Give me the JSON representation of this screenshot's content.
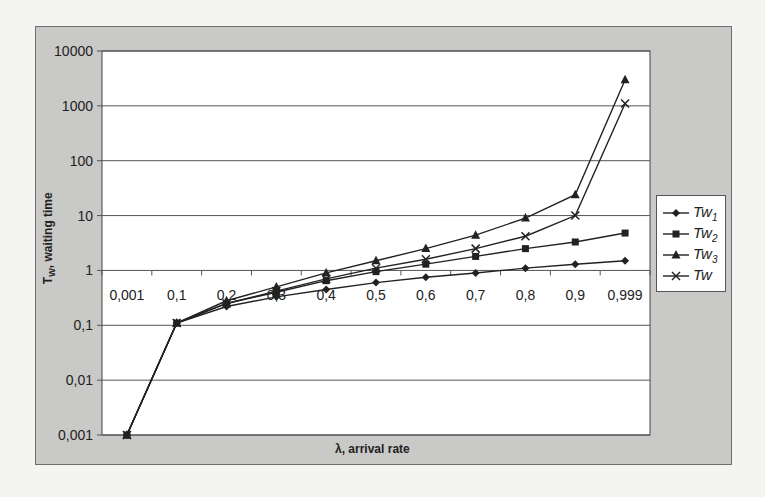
{
  "chart_data": {
    "type": "line",
    "title": "",
    "xlabel": "λ, arrival rate",
    "ylabel": "Tw, waiting time",
    "yscale": "log",
    "ylim": [
      0.001,
      10000
    ],
    "y_ticks": [
      "10000",
      "1000",
      "100",
      "10",
      "1",
      "0,1",
      "0,01",
      "0,001"
    ],
    "categories": [
      "0,001",
      "0,1",
      "0,2",
      "0,3",
      "0,4",
      "0,5",
      "0,6",
      "0,7",
      "0,8",
      "0,9",
      "0,999"
    ],
    "grid": "horizontal",
    "legend_position": "right",
    "series": [
      {
        "name": "Tw1",
        "base": "Tw",
        "sub": "1",
        "marker": "diamond",
        "values": [
          0.001,
          0.11,
          0.22,
          0.33,
          0.45,
          0.6,
          0.75,
          0.9,
          1.1,
          1.3,
          1.5
        ]
      },
      {
        "name": "Tw2",
        "base": "Tw",
        "sub": "2",
        "marker": "square",
        "values": [
          0.001,
          0.11,
          0.25,
          0.4,
          0.65,
          0.95,
          1.3,
          1.8,
          2.5,
          3.3,
          4.8
        ]
      },
      {
        "name": "Tw3",
        "base": "Tw",
        "sub": "3",
        "marker": "triangle",
        "values": [
          0.001,
          0.11,
          0.28,
          0.5,
          0.9,
          1.5,
          2.5,
          4.4,
          9,
          24,
          3000
        ]
      },
      {
        "name": "Tw",
        "base": "Tw",
        "sub": "",
        "marker": "x",
        "values": [
          0.001,
          0.11,
          0.25,
          0.42,
          0.7,
          1.1,
          1.6,
          2.5,
          4.2,
          10,
          1100
        ]
      }
    ]
  },
  "axis": {
    "ytitle_main": "T",
    "ytitle_sub": "W",
    "ytitle_rest": ", waiting time",
    "xtitle": "λ, arrival rate"
  },
  "colors": {
    "frame_bg": "#c9c9c7",
    "plot_bg": "#ffffff",
    "line": "#222222",
    "grid": "#555555"
  }
}
